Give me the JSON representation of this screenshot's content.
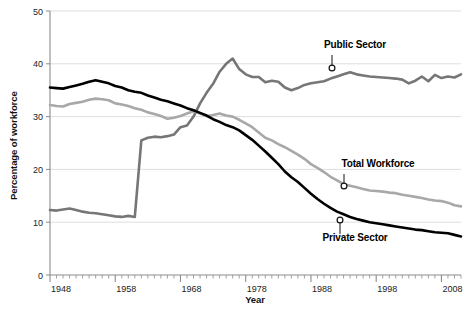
{
  "chart_data": {
    "type": "line",
    "title": "",
    "xlabel": "Year",
    "ylabel": "Percentage of workforce",
    "xlim": [
      1948,
      2011
    ],
    "ylim": [
      0,
      50
    ],
    "grid": true,
    "grid_axis": "y",
    "legend_position": "inline-annotations",
    "xticks": [
      1948,
      1958,
      1968,
      1978,
      1988,
      1998,
      2008
    ],
    "xtick_labels": [
      "1948",
      "1958",
      "1968",
      "1978",
      "1988",
      "1998",
      "2008"
    ],
    "xminor_tick_interval": 1,
    "yticks": [
      0,
      10,
      20,
      30,
      40,
      50
    ],
    "ytick_labels": [
      "0",
      "10",
      "20",
      "30",
      "40",
      "50"
    ],
    "x": [
      1948,
      1949,
      1950,
      1951,
      1952,
      1953,
      1954,
      1955,
      1956,
      1957,
      1958,
      1959,
      1960,
      1961,
      1962,
      1963,
      1964,
      1965,
      1966,
      1967,
      1968,
      1969,
      1970,
      1971,
      1972,
      1973,
      1974,
      1975,
      1976,
      1977,
      1978,
      1979,
      1980,
      1981,
      1982,
      1983,
      1984,
      1985,
      1986,
      1987,
      1988,
      1989,
      1990,
      1991,
      1992,
      1993,
      1994,
      1995,
      1996,
      1997,
      1998,
      1999,
      2000,
      2001,
      2002,
      2003,
      2004,
      2005,
      2006,
      2007,
      2008,
      2009,
      2010,
      2011
    ],
    "series": [
      {
        "name": "Total Workforce",
        "color": "#a8a8a8",
        "marker_style": "open-circle",
        "label_anchor_year": 1993,
        "label_anchor_value": 17.0,
        "values": [
          32.2,
          32.0,
          31.9,
          32.4,
          32.6,
          32.8,
          33.2,
          33.4,
          33.3,
          33.1,
          32.5,
          32.3,
          32.0,
          31.6,
          31.3,
          30.8,
          30.5,
          30.1,
          29.6,
          29.8,
          30.1,
          30.6,
          31.0,
          30.6,
          30.1,
          30.3,
          30.6,
          30.2,
          30.0,
          29.4,
          28.7,
          28.0,
          27.0,
          26.0,
          25.5,
          24.8,
          24.2,
          23.5,
          22.8,
          22.0,
          21.0,
          20.3,
          19.5,
          18.6,
          17.9,
          17.2,
          16.9,
          16.6,
          16.3,
          16.0,
          15.9,
          15.8,
          15.6,
          15.5,
          15.2,
          15.0,
          14.8,
          14.6,
          14.3,
          14.1,
          14.0,
          13.7,
          13.2,
          13.0
        ]
      },
      {
        "name": "Private Sector",
        "color": "#000000",
        "marker_style": "filled-circle",
        "label_anchor_year": 1992,
        "label_anchor_value": 11.8,
        "values": [
          35.5,
          35.4,
          35.3,
          35.6,
          35.9,
          36.2,
          36.6,
          36.9,
          36.6,
          36.3,
          35.8,
          35.5,
          35.0,
          34.7,
          34.5,
          34.0,
          33.6,
          33.2,
          32.9,
          32.5,
          32.1,
          31.6,
          31.2,
          30.7,
          30.2,
          29.5,
          29.0,
          28.4,
          28.0,
          27.4,
          26.5,
          25.6,
          24.5,
          23.4,
          22.2,
          21.0,
          19.6,
          18.5,
          17.6,
          16.5,
          15.4,
          14.4,
          13.5,
          12.7,
          12.0,
          11.5,
          11.0,
          10.6,
          10.3,
          10.0,
          9.8,
          9.6,
          9.4,
          9.2,
          9.0,
          8.8,
          8.6,
          8.5,
          8.3,
          8.1,
          8.0,
          7.9,
          7.6,
          7.3
        ]
      },
      {
        "name": "Public Sector",
        "color": "#767676",
        "marker_style": "open-circle",
        "label_anchor_year": 1993,
        "label_anchor_value": 38.5,
        "values": [
          12.3,
          12.2,
          12.4,
          12.6,
          12.3,
          12.0,
          11.8,
          11.7,
          11.5,
          11.3,
          11.1,
          11.0,
          11.2,
          11.0,
          25.5,
          26.0,
          26.2,
          26.1,
          26.3,
          26.6,
          28.0,
          28.3,
          30.0,
          32.5,
          34.5,
          36.2,
          38.5,
          40.0,
          41.0,
          39.0,
          38.0,
          37.5,
          37.5,
          36.5,
          36.8,
          36.6,
          35.5,
          35.0,
          35.4,
          36.0,
          36.3,
          36.5,
          36.7,
          37.2,
          37.6,
          38.0,
          38.4,
          38.0,
          37.8,
          37.6,
          37.5,
          37.4,
          37.3,
          37.2,
          37.0,
          36.3,
          36.8,
          37.6,
          36.7,
          37.9,
          37.3,
          37.6,
          37.4,
          38.0
        ]
      }
    ]
  },
  "annotations": [
    {
      "id": "public-sector",
      "text": "Public Sector"
    },
    {
      "id": "total-workforce",
      "text": "Total Workforce"
    },
    {
      "id": "private-sector",
      "text": "Private Sector"
    }
  ],
  "axes": {
    "y_title": "Percentage of workforce",
    "x_title": "Year"
  }
}
